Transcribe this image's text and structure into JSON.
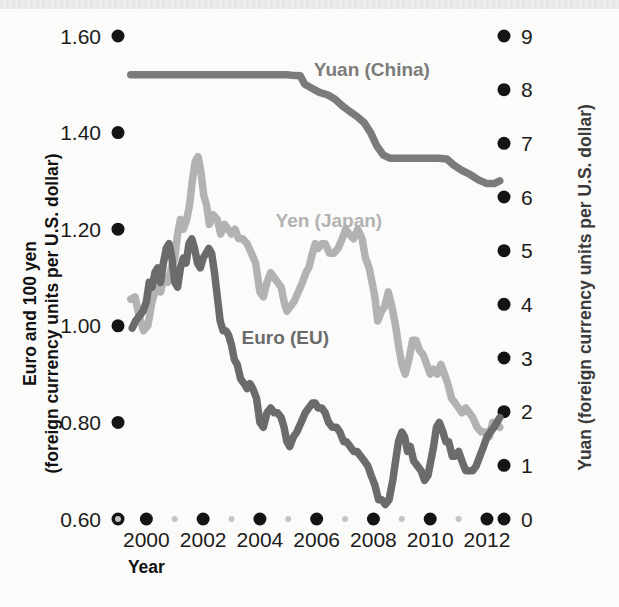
{
  "chart_data": {
    "type": "line",
    "title": "",
    "xlabel": "Year",
    "ylabel_left": "Euro and 100 yen\n(foreign currency units per U.S. dollar)",
    "ylabel_right": "Yuan (foreign currency units per U.S. dollar)",
    "ylabel_left_line1": "Euro and 100 yen",
    "ylabel_left_line2": "(foreign currency units per U.S. dollar)",
    "grid": false,
    "legend_position": "inline-annotations",
    "xlim": [
      1999.0,
      2012.6
    ],
    "xticks_major": [
      "2000",
      "2002",
      "2004",
      "2006",
      "2008",
      "2010",
      "2012"
    ],
    "xticks_major_values": [
      2000,
      2002,
      2004,
      2006,
      2008,
      2010,
      2012
    ],
    "xticks_minor_values": [
      1999,
      2001,
      2003,
      2005,
      2007,
      2009,
      2011
    ],
    "ylim_left": [
      0.6,
      1.6
    ],
    "yticks_left": [
      "0.60",
      "0.80",
      "1.00",
      "1.20",
      "1.40",
      "1.60"
    ],
    "yticks_left_values": [
      0.6,
      0.8,
      1.0,
      1.2,
      1.4,
      1.6
    ],
    "ylim_right": [
      0,
      9
    ],
    "yticks_right": [
      "0",
      "1",
      "2",
      "3",
      "4",
      "5",
      "6",
      "7",
      "8",
      "9"
    ],
    "yticks_right_values": [
      0,
      1,
      2,
      3,
      4,
      5,
      6,
      7,
      8,
      9
    ],
    "colors": {
      "yuan": "#7b7b7b",
      "yen": "#b2b2b2",
      "euro": "#6b6b6b",
      "tick_dot": "#141414",
      "tick_dot_minor": "#c4c4c4",
      "background": "#fbfbf9"
    },
    "series": [
      {
        "name": "Yuan (China)",
        "axis": "right",
        "color": "#7b7b7b",
        "label_x": 2005.9,
        "label_y_right": 8.25,
        "points": [
          [
            1999.45,
            8.28
          ],
          [
            2000.0,
            8.28
          ],
          [
            2000.5,
            8.28
          ],
          [
            2001.0,
            8.28
          ],
          [
            2001.5,
            8.28
          ],
          [
            2002.0,
            8.28
          ],
          [
            2002.5,
            8.28
          ],
          [
            2003.0,
            8.28
          ],
          [
            2003.5,
            8.28
          ],
          [
            2004.0,
            8.28
          ],
          [
            2004.5,
            8.28
          ],
          [
            2004.92,
            8.28
          ],
          [
            2005.12,
            8.27
          ],
          [
            2005.42,
            8.26
          ],
          [
            2005.58,
            8.1
          ],
          [
            2005.85,
            8.02
          ],
          [
            2006.1,
            7.95
          ],
          [
            2006.4,
            7.9
          ],
          [
            2006.65,
            7.82
          ],
          [
            2006.9,
            7.7
          ],
          [
            2007.15,
            7.6
          ],
          [
            2007.42,
            7.5
          ],
          [
            2007.68,
            7.38
          ],
          [
            2007.9,
            7.2
          ],
          [
            2008.12,
            6.95
          ],
          [
            2008.35,
            6.78
          ],
          [
            2008.6,
            6.72
          ],
          [
            2008.9,
            6.72
          ],
          [
            2009.3,
            6.72
          ],
          [
            2009.8,
            6.72
          ],
          [
            2010.3,
            6.72
          ],
          [
            2010.58,
            6.71
          ],
          [
            2010.82,
            6.6
          ],
          [
            2011.1,
            6.5
          ],
          [
            2011.4,
            6.42
          ],
          [
            2011.7,
            6.32
          ],
          [
            2012.0,
            6.25
          ],
          [
            2012.25,
            6.25
          ],
          [
            2012.45,
            6.3
          ]
        ]
      },
      {
        "name": "Yen (Japan)",
        "axis": "left",
        "color": "#b2b2b2",
        "label_x": 2004.55,
        "label_y_left": 1.205,
        "points": [
          [
            1999.45,
            1.055
          ],
          [
            1999.6,
            1.06
          ],
          [
            1999.75,
            1.02
          ],
          [
            1999.9,
            0.99
          ],
          [
            2000.05,
            1.0
          ],
          [
            2000.2,
            1.05
          ],
          [
            2000.35,
            1.08
          ],
          [
            2000.5,
            1.07
          ],
          [
            2000.62,
            1.1
          ],
          [
            2000.75,
            1.09
          ],
          [
            2000.88,
            1.12
          ],
          [
            2001.0,
            1.14
          ],
          [
            2001.1,
            1.19
          ],
          [
            2001.2,
            1.22
          ],
          [
            2001.3,
            1.2
          ],
          [
            2001.42,
            1.22
          ],
          [
            2001.52,
            1.25
          ],
          [
            2001.62,
            1.3
          ],
          [
            2001.72,
            1.34
          ],
          [
            2001.82,
            1.35
          ],
          [
            2001.92,
            1.32
          ],
          [
            2002.02,
            1.27
          ],
          [
            2002.12,
            1.25
          ],
          [
            2002.22,
            1.21
          ],
          [
            2002.35,
            1.23
          ],
          [
            2002.5,
            1.22
          ],
          [
            2002.62,
            1.19
          ],
          [
            2002.75,
            1.21
          ],
          [
            2002.88,
            1.2
          ],
          [
            2003.0,
            1.19
          ],
          [
            2003.12,
            1.2
          ],
          [
            2003.25,
            1.18
          ],
          [
            2003.4,
            1.18
          ],
          [
            2003.55,
            1.17
          ],
          [
            2003.7,
            1.15
          ],
          [
            2003.85,
            1.13
          ],
          [
            2004.0,
            1.07
          ],
          [
            2004.12,
            1.06
          ],
          [
            2004.25,
            1.09
          ],
          [
            2004.38,
            1.11
          ],
          [
            2004.5,
            1.1
          ],
          [
            2004.62,
            1.09
          ],
          [
            2004.75,
            1.08
          ],
          [
            2004.85,
            1.05
          ],
          [
            2004.95,
            1.03
          ],
          [
            2005.08,
            1.04
          ],
          [
            2005.2,
            1.05
          ],
          [
            2005.35,
            1.07
          ],
          [
            2005.5,
            1.09
          ],
          [
            2005.62,
            1.11
          ],
          [
            2005.72,
            1.12
          ],
          [
            2005.85,
            1.15
          ],
          [
            2005.95,
            1.17
          ],
          [
            2006.05,
            1.16
          ],
          [
            2006.18,
            1.17
          ],
          [
            2006.3,
            1.17
          ],
          [
            2006.45,
            1.15
          ],
          [
            2006.6,
            1.15
          ],
          [
            2006.75,
            1.16
          ],
          [
            2006.9,
            1.18
          ],
          [
            2007.02,
            1.2
          ],
          [
            2007.15,
            1.19
          ],
          [
            2007.3,
            1.18
          ],
          [
            2007.45,
            1.2
          ],
          [
            2007.6,
            1.18
          ],
          [
            2007.72,
            1.14
          ],
          [
            2007.85,
            1.12
          ],
          [
            2007.95,
            1.09
          ],
          [
            2008.05,
            1.06
          ],
          [
            2008.15,
            1.01
          ],
          [
            2008.28,
            1.03
          ],
          [
            2008.4,
            1.04
          ],
          [
            2008.52,
            1.07
          ],
          [
            2008.65,
            1.04
          ],
          [
            2008.78,
            1.0
          ],
          [
            2008.88,
            0.96
          ],
          [
            2009.0,
            0.92
          ],
          [
            2009.12,
            0.9
          ],
          [
            2009.25,
            0.93
          ],
          [
            2009.38,
            0.97
          ],
          [
            2009.5,
            0.97
          ],
          [
            2009.62,
            0.95
          ],
          [
            2009.75,
            0.94
          ],
          [
            2009.88,
            0.92
          ],
          [
            2010.0,
            0.9
          ],
          [
            2010.12,
            0.91
          ],
          [
            2010.25,
            0.9
          ],
          [
            2010.38,
            0.92
          ],
          [
            2010.5,
            0.9
          ],
          [
            2010.62,
            0.88
          ],
          [
            2010.75,
            0.85
          ],
          [
            2010.88,
            0.84
          ],
          [
            2011.0,
            0.83
          ],
          [
            2011.12,
            0.82
          ],
          [
            2011.25,
            0.83
          ],
          [
            2011.38,
            0.82
          ],
          [
            2011.5,
            0.81
          ],
          [
            2011.65,
            0.79
          ],
          [
            2011.8,
            0.78
          ],
          [
            2011.95,
            0.78
          ],
          [
            2012.08,
            0.77
          ],
          [
            2012.2,
            0.8
          ],
          [
            2012.32,
            0.8
          ],
          [
            2012.45,
            0.79
          ]
        ]
      },
      {
        "name": "Euro (EU)",
        "axis": "left",
        "color": "#6b6b6b",
        "label_x": 2003.35,
        "label_y_left": 0.963,
        "points": [
          [
            1999.5,
            0.995
          ],
          [
            1999.62,
            1.01
          ],
          [
            1999.75,
            1.02
          ],
          [
            1999.88,
            1.03
          ],
          [
            2000.0,
            1.05
          ],
          [
            2000.1,
            1.09
          ],
          [
            2000.2,
            1.08
          ],
          [
            2000.3,
            1.11
          ],
          [
            2000.4,
            1.12
          ],
          [
            2000.5,
            1.09
          ],
          [
            2000.6,
            1.13
          ],
          [
            2000.7,
            1.16
          ],
          [
            2000.8,
            1.17
          ],
          [
            2000.9,
            1.14
          ],
          [
            2001.0,
            1.09
          ],
          [
            2001.1,
            1.08
          ],
          [
            2001.2,
            1.12
          ],
          [
            2001.3,
            1.14
          ],
          [
            2001.4,
            1.13
          ],
          [
            2001.5,
            1.17
          ],
          [
            2001.6,
            1.18
          ],
          [
            2001.7,
            1.16
          ],
          [
            2001.8,
            1.13
          ],
          [
            2001.9,
            1.12
          ],
          [
            2002.0,
            1.14
          ],
          [
            2002.1,
            1.15
          ],
          [
            2002.2,
            1.16
          ],
          [
            2002.3,
            1.15
          ],
          [
            2002.4,
            1.11
          ],
          [
            2002.5,
            1.06
          ],
          [
            2002.6,
            1.01
          ],
          [
            2002.7,
            0.99
          ],
          [
            2002.8,
            0.99
          ],
          [
            2002.9,
            0.98
          ],
          [
            2003.0,
            0.96
          ],
          [
            2003.1,
            0.93
          ],
          [
            2003.2,
            0.92
          ],
          [
            2003.32,
            0.89
          ],
          [
            2003.45,
            0.88
          ],
          [
            2003.55,
            0.87
          ],
          [
            2003.65,
            0.88
          ],
          [
            2003.75,
            0.87
          ],
          [
            2003.88,
            0.85
          ],
          [
            2004.0,
            0.8
          ],
          [
            2004.12,
            0.79
          ],
          [
            2004.25,
            0.82
          ],
          [
            2004.38,
            0.83
          ],
          [
            2004.5,
            0.82
          ],
          [
            2004.62,
            0.82
          ],
          [
            2004.75,
            0.81
          ],
          [
            2004.85,
            0.79
          ],
          [
            2004.95,
            0.76
          ],
          [
            2005.05,
            0.75
          ],
          [
            2005.18,
            0.77
          ],
          [
            2005.3,
            0.78
          ],
          [
            2005.45,
            0.8
          ],
          [
            2005.6,
            0.82
          ],
          [
            2005.72,
            0.83
          ],
          [
            2005.85,
            0.84
          ],
          [
            2005.95,
            0.84
          ],
          [
            2006.05,
            0.83
          ],
          [
            2006.18,
            0.83
          ],
          [
            2006.3,
            0.82
          ],
          [
            2006.42,
            0.8
          ],
          [
            2006.55,
            0.79
          ],
          [
            2006.7,
            0.79
          ],
          [
            2006.82,
            0.78
          ],
          [
            2006.95,
            0.76
          ],
          [
            2007.05,
            0.76
          ],
          [
            2007.18,
            0.75
          ],
          [
            2007.3,
            0.74
          ],
          [
            2007.42,
            0.74
          ],
          [
            2007.55,
            0.73
          ],
          [
            2007.68,
            0.72
          ],
          [
            2007.8,
            0.71
          ],
          [
            2007.92,
            0.69
          ],
          [
            2008.05,
            0.67
          ],
          [
            2008.18,
            0.64
          ],
          [
            2008.3,
            0.64
          ],
          [
            2008.42,
            0.63
          ],
          [
            2008.55,
            0.64
          ],
          [
            2008.68,
            0.68
          ],
          [
            2008.78,
            0.72
          ],
          [
            2008.88,
            0.76
          ],
          [
            2009.0,
            0.78
          ],
          [
            2009.1,
            0.77
          ],
          [
            2009.2,
            0.74
          ],
          [
            2009.3,
            0.75
          ],
          [
            2009.42,
            0.72
          ],
          [
            2009.55,
            0.71
          ],
          [
            2009.68,
            0.7
          ],
          [
            2009.8,
            0.68
          ],
          [
            2009.92,
            0.69
          ],
          [
            2010.02,
            0.72
          ],
          [
            2010.12,
            0.75
          ],
          [
            2010.22,
            0.79
          ],
          [
            2010.32,
            0.8
          ],
          [
            2010.45,
            0.78
          ],
          [
            2010.55,
            0.76
          ],
          [
            2010.65,
            0.76
          ],
          [
            2010.78,
            0.73
          ],
          [
            2010.88,
            0.73
          ],
          [
            2011.0,
            0.74
          ],
          [
            2011.12,
            0.72
          ],
          [
            2011.25,
            0.7
          ],
          [
            2011.38,
            0.7
          ],
          [
            2011.5,
            0.7
          ],
          [
            2011.62,
            0.71
          ],
          [
            2011.75,
            0.73
          ],
          [
            2011.88,
            0.75
          ],
          [
            2012.0,
            0.77
          ],
          [
            2012.12,
            0.78
          ],
          [
            2012.25,
            0.79
          ],
          [
            2012.35,
            0.8
          ],
          [
            2012.45,
            0.81
          ]
        ]
      }
    ]
  }
}
